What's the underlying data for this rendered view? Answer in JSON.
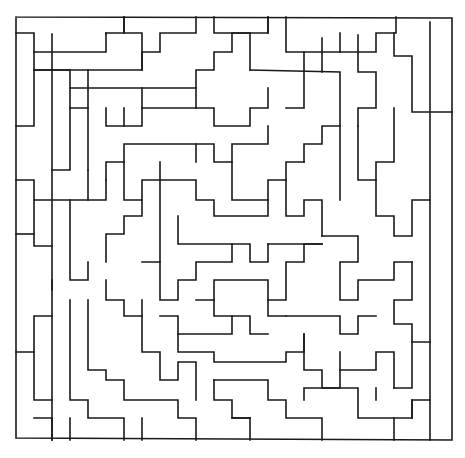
{
  "figure": {
    "stroke_color": "#1a1a1a",
    "background": "#ffffff",
    "border": [
      [
        16,
        17
      ],
      [
        452,
        18
      ],
      [
        452,
        440
      ],
      [
        16,
        438
      ],
      [
        16,
        17
      ]
    ],
    "paths": [
      [
        [
          16,
          33
        ],
        [
          34,
          33
        ],
        [
          34,
          52
        ],
        [
          106,
          52
        ],
        [
          106,
          33
        ],
        [
          124,
          33
        ],
        [
          124,
          17
        ]
      ],
      [
        [
          34,
          52
        ],
        [
          34,
          70
        ],
        [
          142,
          70
        ],
        [
          142,
          52
        ],
        [
          160,
          52
        ],
        [
          160,
          33
        ],
        [
          196,
          33
        ],
        [
          196,
          17
        ]
      ],
      [
        [
          124,
          17
        ],
        [
          124,
          33
        ],
        [
          142,
          33
        ],
        [
          142,
          70
        ]
      ],
      [
        [
          52,
          34
        ],
        [
          52,
          440
        ]
      ],
      [
        [
          106,
          33
        ],
        [
          106,
          34
        ]
      ],
      [
        [
          16,
          126
        ],
        [
          34,
          126
        ],
        [
          34,
          70
        ]
      ],
      [
        [
          34,
          70
        ],
        [
          70,
          70
        ],
        [
          70,
          88
        ],
        [
          196,
          88
        ],
        [
          196,
          70
        ],
        [
          214,
          70
        ],
        [
          214,
          52
        ],
        [
          232,
          52
        ],
        [
          232,
          33
        ],
        [
          268,
          33
        ],
        [
          268,
          17
        ]
      ],
      [
        [
          88,
          70
        ],
        [
          88,
          170
        ]
      ],
      [
        [
          70,
          88
        ],
        [
          70,
          108
        ],
        [
          88,
          108
        ]
      ],
      [
        [
          214,
          17
        ],
        [
          214,
          33
        ],
        [
          250,
          33
        ],
        [
          250,
          70
        ]
      ],
      [
        [
          142,
          88
        ],
        [
          142,
          108
        ],
        [
          214,
          108
        ],
        [
          214,
          126
        ],
        [
          250,
          126
        ],
        [
          250,
          108
        ],
        [
          268,
          108
        ],
        [
          268,
          88
        ]
      ],
      [
        [
          196,
          88
        ],
        [
          196,
          108
        ]
      ],
      [
        [
          70,
          108
        ],
        [
          70,
          170
        ],
        [
          52,
          170
        ]
      ],
      [
        [
          106,
          108
        ],
        [
          106,
          126
        ],
        [
          124,
          126
        ],
        [
          124,
          108
        ]
      ],
      [
        [
          124,
          126
        ],
        [
          142,
          126
        ],
        [
          142,
          108
        ]
      ],
      [
        [
          250,
          70
        ],
        [
          340,
          72
        ],
        [
          340,
          126
        ],
        [
          322,
          126
        ],
        [
          322,
          144
        ],
        [
          304,
          144
        ],
        [
          304,
          162
        ]
      ],
      [
        [
          286,
          17
        ],
        [
          286,
          52
        ],
        [
          376,
          52
        ],
        [
          376,
          33
        ],
        [
          396,
          33
        ],
        [
          396,
          17
        ]
      ],
      [
        [
          304,
          52
        ],
        [
          304,
          108
        ],
        [
          286,
          108
        ]
      ],
      [
        [
          340,
          33
        ],
        [
          340,
          52
        ]
      ],
      [
        [
          358,
          35
        ],
        [
          358,
          72
        ],
        [
          376,
          72
        ],
        [
          376,
          108
        ],
        [
          358,
          108
        ],
        [
          358,
          126
        ]
      ],
      [
        [
          394,
          33
        ],
        [
          394,
          56
        ],
        [
          412,
          56
        ],
        [
          412,
          112
        ],
        [
          452,
          112
        ]
      ],
      [
        [
          268,
          33
        ],
        [
          268,
          17
        ]
      ],
      [
        [
          322,
          38
        ],
        [
          322,
          72
        ]
      ],
      [
        [
          430,
          22
        ],
        [
          430,
          440
        ]
      ],
      [
        [
          16,
          180
        ],
        [
          34,
          180
        ],
        [
          34,
          200
        ],
        [
          106,
          200
        ],
        [
          106,
          180
        ]
      ],
      [
        [
          34,
          200
        ],
        [
          34,
          246
        ],
        [
          52,
          246
        ]
      ],
      [
        [
          16,
          234
        ],
        [
          34,
          234
        ]
      ],
      [
        [
          88,
          170
        ],
        [
          88,
          200
        ]
      ],
      [
        [
          106,
          180
        ],
        [
          106,
          162
        ],
        [
          124,
          162
        ],
        [
          124,
          144
        ],
        [
          214,
          144
        ],
        [
          214,
          162
        ],
        [
          232,
          162
        ],
        [
          232,
          144
        ],
        [
          268,
          144
        ],
        [
          268,
          126
        ]
      ],
      [
        [
          124,
          162
        ],
        [
          124,
          200
        ],
        [
          142,
          200
        ],
        [
          142,
          180
        ],
        [
          196,
          180
        ],
        [
          196,
          200
        ],
        [
          214,
          200
        ],
        [
          214,
          216
        ],
        [
          268,
          216
        ],
        [
          268,
          200
        ]
      ],
      [
        [
          160,
          162
        ],
        [
          160,
          262
        ],
        [
          142,
          262
        ]
      ],
      [
        [
          196,
          144
        ],
        [
          196,
          162
        ]
      ],
      [
        [
          232,
          162
        ],
        [
          232,
          200
        ],
        [
          268,
          200
        ],
        [
          268,
          180
        ],
        [
          286,
          180
        ],
        [
          286,
          162
        ],
        [
          304,
          162
        ]
      ],
      [
        [
          286,
          180
        ],
        [
          286,
          216
        ],
        [
          304,
          216
        ],
        [
          304,
          200
        ],
        [
          322,
          200
        ],
        [
          322,
          236
        ]
      ],
      [
        [
          358,
          126
        ],
        [
          358,
          180
        ],
        [
          376,
          180
        ],
        [
          376,
          162
        ],
        [
          394,
          162
        ],
        [
          394,
          108
        ]
      ],
      [
        [
          376,
          180
        ],
        [
          376,
          216
        ],
        [
          394,
          216
        ],
        [
          394,
          236
        ],
        [
          412,
          236
        ],
        [
          412,
          200
        ],
        [
          430,
          200
        ]
      ],
      [
        [
          340,
          126
        ],
        [
          340,
          200
        ]
      ],
      [
        [
          106,
          262
        ],
        [
          106,
          234
        ],
        [
          124,
          234
        ],
        [
          124,
          216
        ],
        [
          142,
          216
        ],
        [
          142,
          200
        ]
      ],
      [
        [
          70,
          200
        ],
        [
          70,
          280
        ],
        [
          88,
          280
        ],
        [
          88,
          262
        ]
      ],
      [
        [
          52,
          280
        ],
        [
          52,
          290
        ]
      ],
      [
        [
          160,
          262
        ],
        [
          160,
          300
        ],
        [
          178,
          300
        ],
        [
          178,
          280
        ],
        [
          196,
          280
        ],
        [
          196,
          262
        ],
        [
          232,
          262
        ],
        [
          232,
          244
        ],
        [
          250,
          244
        ],
        [
          250,
          262
        ],
        [
          268,
          262
        ],
        [
          268,
          244
        ]
      ],
      [
        [
          178,
          216
        ],
        [
          178,
          244
        ],
        [
          232,
          244
        ]
      ],
      [
        [
          196,
          300
        ],
        [
          214,
          300
        ],
        [
          214,
          280
        ],
        [
          268,
          280
        ],
        [
          268,
          300
        ],
        [
          286,
          300
        ],
        [
          286,
          262
        ],
        [
          304,
          262
        ],
        [
          304,
          244
        ],
        [
          322,
          244
        ]
      ],
      [
        [
          268,
          244
        ],
        [
          322,
          244
        ]
      ],
      [
        [
          322,
          236
        ],
        [
          358,
          236
        ],
        [
          358,
          262
        ],
        [
          340,
          262
        ],
        [
          340,
          300
        ],
        [
          358,
          300
        ],
        [
          358,
          280
        ],
        [
          394,
          280
        ],
        [
          394,
          262
        ],
        [
          412,
          262
        ]
      ],
      [
        [
          412,
          262
        ],
        [
          412,
          300
        ],
        [
          394,
          300
        ],
        [
          394,
          324
        ],
        [
          412,
          324
        ],
        [
          412,
          342
        ],
        [
          430,
          342
        ]
      ],
      [
        [
          16,
          352
        ],
        [
          34,
          352
        ],
        [
          34,
          400
        ],
        [
          52,
          400
        ]
      ],
      [
        [
          52,
          316
        ],
        [
          34,
          316
        ],
        [
          34,
          352
        ]
      ],
      [
        [
          70,
          300
        ],
        [
          70,
          400
        ],
        [
          88,
          400
        ],
        [
          88,
          418
        ],
        [
          124,
          418
        ],
        [
          124,
          440
        ]
      ],
      [
        [
          88,
          300
        ],
        [
          88,
          370
        ],
        [
          106,
          370
        ],
        [
          106,
          380
        ],
        [
          124,
          380
        ],
        [
          124,
          400
        ],
        [
          178,
          400
        ],
        [
          178,
          418
        ],
        [
          196,
          418
        ],
        [
          196,
          440
        ]
      ],
      [
        [
          106,
          280
        ],
        [
          106,
          300
        ],
        [
          124,
          300
        ],
        [
          124,
          316
        ],
        [
          142,
          316
        ],
        [
          142,
          352
        ],
        [
          160,
          352
        ],
        [
          160,
          380
        ],
        [
          178,
          380
        ],
        [
          178,
          362
        ],
        [
          196,
          362
        ],
        [
          196,
          400
        ]
      ],
      [
        [
          142,
          300
        ],
        [
          142,
          316
        ]
      ],
      [
        [
          160,
          316
        ],
        [
          178,
          316
        ],
        [
          178,
          334
        ],
        [
          232,
          334
        ],
        [
          232,
          316
        ],
        [
          250,
          316
        ],
        [
          250,
          334
        ],
        [
          268,
          334
        ]
      ],
      [
        [
          178,
          334
        ],
        [
          178,
          352
        ],
        [
          214,
          352
        ],
        [
          214,
          362
        ],
        [
          286,
          362
        ],
        [
          286,
          352
        ],
        [
          304,
          352
        ],
        [
          304,
          334
        ]
      ],
      [
        [
          214,
          300
        ],
        [
          214,
          316
        ],
        [
          232,
          316
        ]
      ],
      [
        [
          268,
          300
        ],
        [
          268,
          316
        ],
        [
          286,
          316
        ]
      ],
      [
        [
          286,
          316
        ],
        [
          340,
          316
        ],
        [
          340,
          334
        ],
        [
          358,
          334
        ],
        [
          358,
          316
        ],
        [
          376,
          316
        ]
      ],
      [
        [
          304,
          334
        ],
        [
          304,
          370
        ],
        [
          322,
          370
        ],
        [
          322,
          388
        ],
        [
          340,
          388
        ],
        [
          340,
          352
        ]
      ],
      [
        [
          340,
          370
        ],
        [
          376,
          370
        ],
        [
          376,
          352
        ],
        [
          394,
          352
        ],
        [
          394,
          388
        ]
      ],
      [
        [
          214,
          380
        ],
        [
          214,
          400
        ],
        [
          232,
          400
        ],
        [
          232,
          418
        ],
        [
          250,
          418
        ],
        [
          250,
          440
        ]
      ],
      [
        [
          214,
          380
        ],
        [
          268,
          380
        ],
        [
          268,
          400
        ],
        [
          286,
          400
        ],
        [
          286,
          418
        ],
        [
          322,
          418
        ],
        [
          322,
          440
        ]
      ],
      [
        [
          304,
          400
        ],
        [
          304,
          388
        ],
        [
          358,
          388
        ],
        [
          358,
          418
        ],
        [
          412,
          418
        ],
        [
          412,
          400
        ],
        [
          430,
          400
        ]
      ],
      [
        [
          376,
          388
        ],
        [
          376,
          400
        ]
      ],
      [
        [
          394,
          418
        ],
        [
          394,
          440
        ]
      ],
      [
        [
          412,
          342
        ],
        [
          412,
          388
        ],
        [
          394,
          388
        ]
      ],
      [
        [
          412,
          400
        ],
        [
          412,
          418
        ]
      ],
      [
        [
          250,
          418
        ],
        [
          232,
          418
        ]
      ],
      [
        [
          142,
          418
        ],
        [
          142,
          440
        ]
      ],
      [
        [
          34,
          418
        ],
        [
          52,
          418
        ],
        [
          52,
          440
        ]
      ],
      [
        [
          70,
          418
        ],
        [
          70,
          440
        ]
      ]
    ]
  }
}
